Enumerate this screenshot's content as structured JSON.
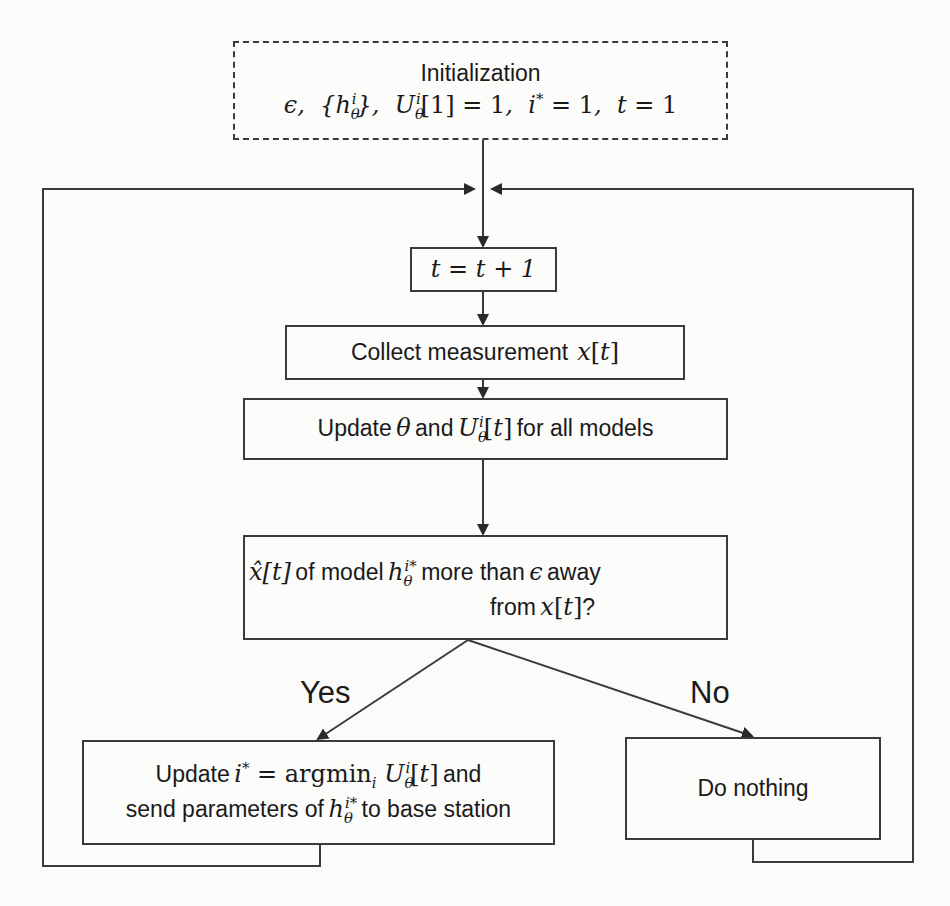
{
  "diagram": {
    "type": "flowchart",
    "colors": {
      "line": "#3a3a3a",
      "background": "#fbfbf9",
      "text": "#1a1a1a"
    },
    "nodes": {
      "init": {
        "title": "Initialization",
        "params": "ϵ, {hθⁱ}, Uθⁱ[1] = 1, i* = 1, t = 1",
        "style": "dashed"
      },
      "increment": {
        "text": "t = t + 1"
      },
      "collect": {
        "text": "Collect measurement",
        "math": "x[t]"
      },
      "update": {
        "prefix": "Update",
        "theta": "θ",
        "and": "and",
        "utility": "Uθⁱ[t]",
        "suffix": "for all models"
      },
      "decision": {
        "xhat": "x̂[t]",
        "line1_mid": "of model",
        "model": "hθ^{i*}",
        "line1_end": "more than",
        "epsilon": "ϵ",
        "away": "away",
        "line2_prefix": "from",
        "line2_math": "x[t]",
        "line2_suffix": "?"
      },
      "yes_action": {
        "line1_prefix": "Update",
        "line1_math": "i* = argminᵢ Uθⁱ[t]",
        "line1_suffix": "and",
        "line2_prefix": "send parameters of",
        "line2_math": "hθ^{i*}",
        "line2_suffix": "to base station"
      },
      "no_action": {
        "text": "Do nothing"
      }
    },
    "edge_labels": {
      "yes": "Yes",
      "no": "No"
    },
    "edges": [
      {
        "from": "init",
        "to": "increment"
      },
      {
        "from": "increment",
        "to": "collect"
      },
      {
        "from": "collect",
        "to": "update"
      },
      {
        "from": "update",
        "to": "decision"
      },
      {
        "from": "decision",
        "to": "yes_action",
        "label": "Yes"
      },
      {
        "from": "decision",
        "to": "no_action",
        "label": "No"
      },
      {
        "from": "yes_action",
        "to": "increment",
        "type": "loop-back-left"
      },
      {
        "from": "no_action",
        "to": "increment",
        "type": "loop-back-right"
      }
    ]
  }
}
